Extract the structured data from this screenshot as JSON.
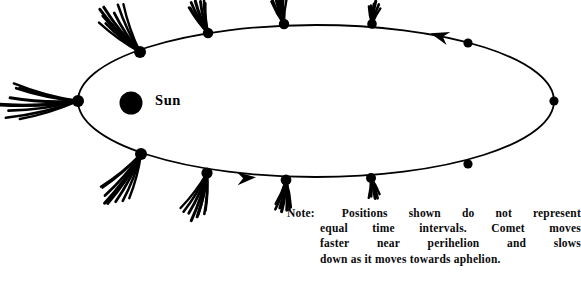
{
  "figure": {
    "sun": {
      "label": "Sun",
      "cx": 131,
      "cy": 103,
      "r": 11.5,
      "color": "#000000"
    },
    "orbit": {
      "cx": 316,
      "cy": 101,
      "rx": 238,
      "ry": 76,
      "stroke": "#000000",
      "stroke_width": 1.8,
      "fill": "none",
      "direction": "counterclockwise"
    },
    "perihelion_label": "perihelion",
    "aphelion_label": "aphelion",
    "positions": [
      {
        "name": "perihelion",
        "cx": 78,
        "cy": 101,
        "r": 6.0,
        "tail_angle": 180,
        "tail_length": 68,
        "strands": 9
      },
      {
        "name": "pos-upper-1",
        "cx": 140,
        "cy": 52,
        "r": 6.0,
        "tail_angle": 231,
        "tail_length": 50,
        "strands": 8
      },
      {
        "name": "pos-upper-2",
        "cx": 208,
        "cy": 33,
        "r": 5.2,
        "tail_angle": 249,
        "tail_length": 32,
        "strands": 7
      },
      {
        "name": "pos-upper-3",
        "cx": 284,
        "cy": 24,
        "r": 5.2,
        "tail_angle": 258,
        "tail_length": 28,
        "strands": 7
      },
      {
        "name": "pos-upper-4",
        "cx": 372,
        "cy": 24,
        "r": 4.8,
        "tail_angle": 278,
        "tail_length": 20,
        "strands": 6
      },
      {
        "name": "pos-upper-5",
        "cx": 468,
        "cy": 43,
        "r": 4.6,
        "tail_angle": 300,
        "tail_length": 0,
        "strands": 0
      },
      {
        "name": "aphelion",
        "cx": 554,
        "cy": 101,
        "r": 4.6,
        "tail_angle": 0,
        "tail_length": 0,
        "strands": 0
      },
      {
        "name": "pos-lower-5",
        "cx": 468,
        "cy": 164,
        "r": 4.6,
        "tail_angle": 60,
        "tail_length": 0,
        "strands": 0
      },
      {
        "name": "pos-lower-4",
        "cx": 371,
        "cy": 178,
        "r": 5.0,
        "tail_angle": 80,
        "tail_length": 20,
        "strands": 5
      },
      {
        "name": "pos-lower-3",
        "cx": 286,
        "cy": 180,
        "r": 5.4,
        "tail_angle": 96,
        "tail_length": 30,
        "strands": 7
      },
      {
        "name": "pos-lower-2",
        "cx": 207,
        "cy": 173,
        "r": 5.6,
        "tail_angle": 108,
        "tail_length": 42,
        "strands": 8
      },
      {
        "name": "pos-lower-1",
        "cx": 141,
        "cy": 154,
        "r": 6.0,
        "tail_angle": 124,
        "tail_length": 52,
        "strands": 8
      }
    ],
    "arrows": [
      {
        "name": "arrow-upper",
        "x": 440,
        "y": 36,
        "angle": 196,
        "size": 16
      },
      {
        "name": "arrow-lower",
        "x": 246,
        "y": 178,
        "angle": 356,
        "size": 16
      }
    ]
  },
  "note": {
    "label": "Note:",
    "lines": [
      [
        "Positions",
        "shown",
        "do",
        "not",
        "represent"
      ],
      [
        "equal",
        "time",
        "intervals.",
        "Comet",
        "moves"
      ],
      [
        "faster",
        "near",
        "perihelion",
        "and",
        "slows"
      ],
      [
        "down as it moves towards aphelion."
      ]
    ],
    "full_text": "Note: Positions shown do not represent equal time intervals. Comet moves faster near perihelion and slows down as it moves towards aphelion."
  }
}
